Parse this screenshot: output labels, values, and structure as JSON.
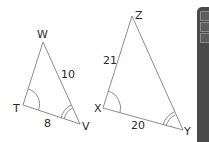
{
  "figure": {
    "triangles": [
      {
        "name": "TWV",
        "vertices": {
          "W": "W",
          "T": "T",
          "V": "V"
        },
        "sides": {
          "WV": "10",
          "TV": "8"
        },
        "angle_marks": {
          "T": "single arc",
          "V": "double arc"
        }
      },
      {
        "name": "XZY",
        "vertices": {
          "Z": "Z",
          "X": "X",
          "Y": "Y"
        },
        "sides": {
          "XZ": "21",
          "XY": "20"
        },
        "angle_marks": {
          "X": "single arc",
          "Y": "double arc"
        }
      }
    ],
    "line_color": "#8c8c8c",
    "text_color": "#2a2a2a"
  },
  "side_panel": {
    "color": "#4a4a4a",
    "buttons": 3
  }
}
